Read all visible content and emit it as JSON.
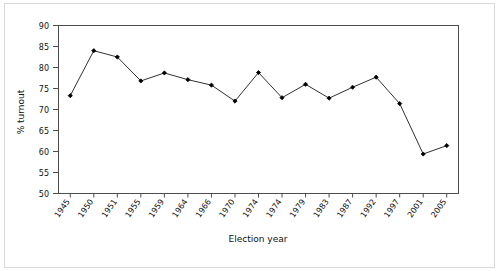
{
  "chart_data": {
    "type": "line",
    "title": "",
    "xlabel": "Election year",
    "ylabel": "% turnout",
    "ylim": [
      50,
      90
    ],
    "yticks": [
      50,
      55,
      60,
      65,
      70,
      75,
      80,
      85,
      90
    ],
    "grid": false,
    "legend": null,
    "marker": "filled-diamond",
    "line_color": "#1a1a1a",
    "marker_color": "#000000",
    "categories": [
      "1945",
      "1950",
      "1951",
      "1955",
      "1959",
      "1964",
      "1966",
      "1970",
      "1974",
      "1974",
      "1979",
      "1983",
      "1987",
      "1992",
      "1997",
      "2001",
      "2005"
    ],
    "values": [
      73.3,
      84.0,
      82.5,
      76.8,
      78.7,
      77.1,
      75.8,
      72.0,
      78.8,
      72.8,
      76.0,
      72.7,
      75.3,
      77.7,
      71.4,
      59.4,
      61.4
    ],
    "series": [
      {
        "name": "% turnout",
        "values": [
          73.3,
          84.0,
          82.5,
          76.8,
          78.7,
          77.1,
          75.8,
          72.0,
          78.8,
          72.8,
          76.0,
          72.7,
          75.3,
          77.7,
          71.4,
          59.4,
          61.4
        ]
      }
    ]
  },
  "figure": {
    "background_color": "#ffffff",
    "frame_color": "#d9d9d9",
    "plot_border_color": "#4d4d4d"
  }
}
